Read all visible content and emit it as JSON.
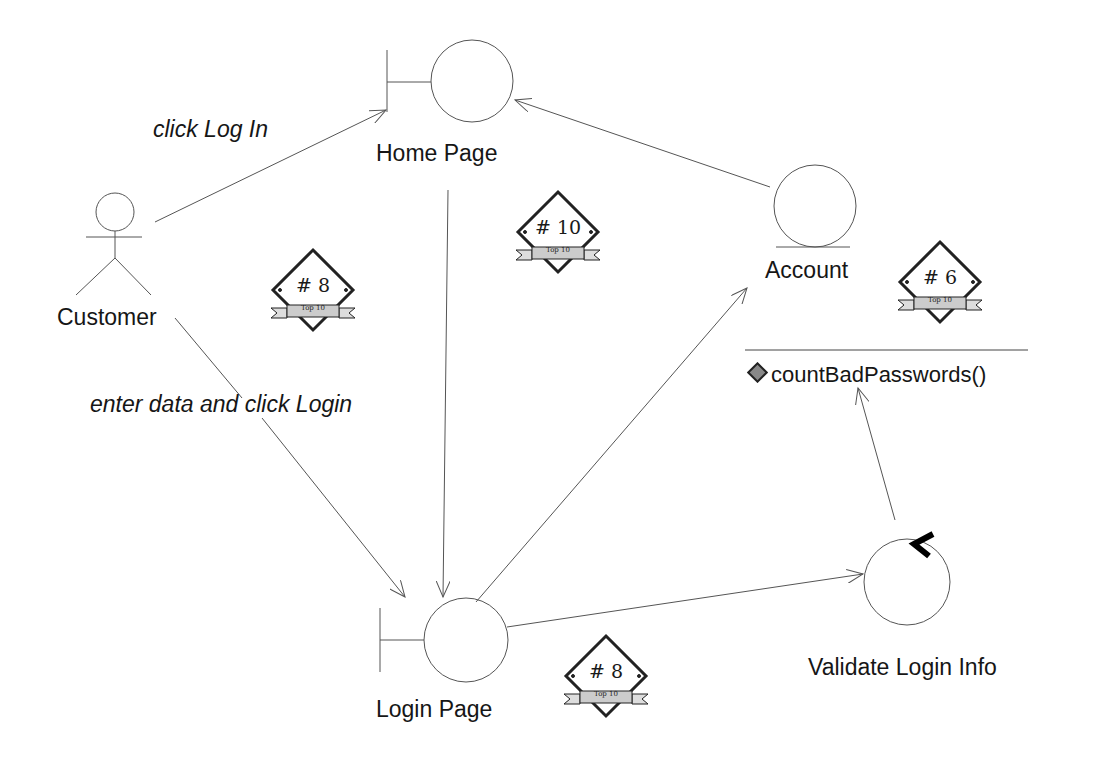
{
  "diagram": {
    "type": "UML robustness diagram",
    "actors": [
      {
        "id": "customer",
        "label": "Customer"
      }
    ],
    "boundaries": [
      {
        "id": "home",
        "label": "Home Page"
      },
      {
        "id": "login",
        "label": "Login Page"
      }
    ],
    "entities": [
      {
        "id": "account",
        "label": "Account"
      }
    ],
    "controls": [
      {
        "id": "validate",
        "label": "Validate Login Info"
      }
    ],
    "operations": [
      {
        "label": "countBadPasswords()"
      }
    ],
    "messages": [
      {
        "label": "click Log In",
        "from": "Customer",
        "to": "Home Page"
      },
      {
        "label": "enter data and click Login",
        "from": "Customer",
        "to": "Login Page"
      }
    ],
    "badges": [
      {
        "number": "# 8",
        "ribbon": "Top 10"
      },
      {
        "number": "# 10",
        "ribbon": "Top 10"
      },
      {
        "number": "# 6",
        "ribbon": "Top 10"
      },
      {
        "number": "# 8",
        "ribbon": "Top 10"
      }
    ]
  }
}
